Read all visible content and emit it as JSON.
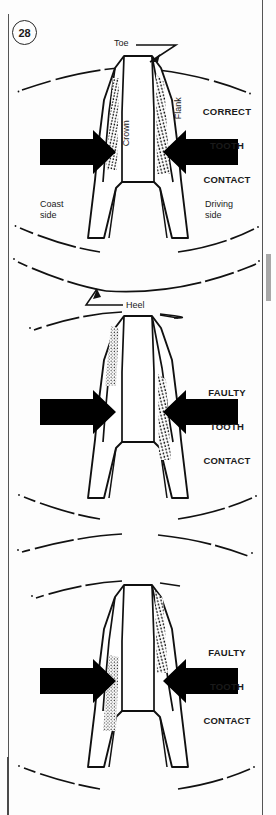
{
  "figure": {
    "number": "28",
    "title_implicit": "Bevel gear tooth contact patterns"
  },
  "colors": {
    "ink": "#1a1a1a",
    "line": "#111111",
    "arrow_fill": "#000000",
    "paper": "#fdfdfd",
    "frame": "#555555",
    "side_tab": "#a8a8a8"
  },
  "callouts": {
    "toe": "Toe",
    "heel": "Heel",
    "crown": "Crown",
    "flank": "Flank",
    "coast_side": "Coast\nside",
    "driving_side": "Driving\nside"
  },
  "panels": [
    {
      "id": "panel-1",
      "verdict_lines": [
        "CORRECT",
        "TOOTH",
        "CONTACT"
      ],
      "verdict": "CORRECT TOOTH CONTACT",
      "contact_pattern": "centered-both-flanks",
      "wear_patches": [
        "coast-flank-full-length",
        "drive-flank-full-length"
      ],
      "arrows": [
        "arrow-left-to-right",
        "arrow-right-to-left"
      ],
      "labels_shown": [
        "Toe",
        "Crown",
        "Flank",
        "Coast side",
        "Driving side",
        "Heel"
      ]
    },
    {
      "id": "panel-2",
      "verdict_lines": [
        "FAULTY",
        "TOOTH",
        "CONTACT"
      ],
      "verdict": "FAULTY TOOTH CONTACT",
      "contact_pattern": "toe-on-coast-heel-on-drive",
      "wear_patches": [
        "coast-flank-toe-end",
        "drive-flank-heel-end"
      ],
      "arrows": [
        "arrow-left-to-right",
        "arrow-right-to-left"
      ],
      "labels_shown": [
        "FAULTY TOOTH CONTACT"
      ]
    },
    {
      "id": "panel-3",
      "verdict_lines": [
        "FAULTY",
        "TOOTH",
        "CONTACT"
      ],
      "verdict": "FAULTY TOOTH CONTACT",
      "contact_pattern": "heel-on-coast-toe-on-drive",
      "wear_patches": [
        "coast-flank-heel-end",
        "drive-flank-toe-end"
      ],
      "arrows": [
        "arrow-left-to-right",
        "arrow-right-to-left"
      ],
      "labels_shown": [
        "FAULTY TOOTH CONTACT"
      ]
    }
  ]
}
